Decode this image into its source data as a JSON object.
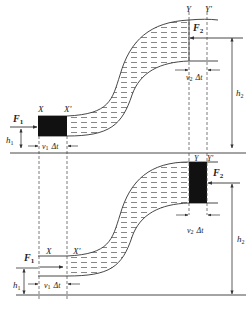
{
  "figure": {
    "caption": "",
    "top_panel": {
      "labels": {
        "x": "X",
        "x_prime": "X'",
        "y": "Y",
        "y_prime": "Y'",
        "f1": "F",
        "f1_sub": "1",
        "f2": "F",
        "f2_sub": "2",
        "h1": "h",
        "h1_sub": "1",
        "h2": "h",
        "h2_sub": "2",
        "v1": "v",
        "v1_sub": "1",
        "v1_dt": "Δt",
        "v2": "v",
        "v2_sub": "2",
        "v2_dt": "Δt"
      }
    },
    "bottom_panel": {
      "labels": {
        "x": "X",
        "x_prime": "X'",
        "y": "Y",
        "y_prime": "Y'",
        "f1": "F",
        "f1_sub": "1",
        "f2": "F",
        "f2_sub": "2",
        "h1": "h",
        "h1_sub": "1",
        "h2": "h",
        "h2_sub": "2",
        "v1": "v",
        "v1_sub": "1",
        "v1_dt": "Δt",
        "v2": "v",
        "v2_sub": "2",
        "v2_dt": "Δt"
      }
    },
    "colors": {
      "line": "#333333",
      "fill_block": "#111111",
      "dash": "#444444",
      "background": "#ffffff"
    }
  }
}
